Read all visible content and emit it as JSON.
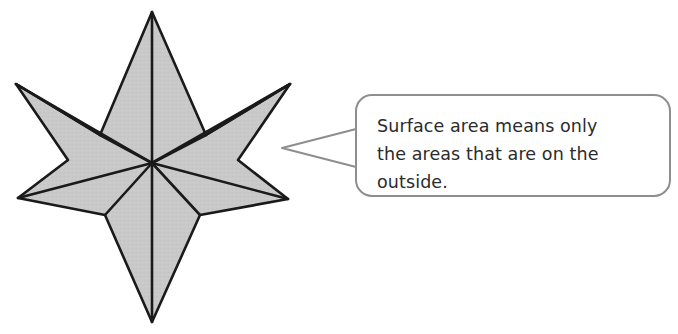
{
  "figure": {
    "background_color": "#ffffff"
  },
  "shape": {
    "name": "six-pointed-stellated-polyhedron",
    "fill_color": "#c9c9c9",
    "stroke_color": "#1a1a1a",
    "stroke_width": 2.6,
    "points": 6,
    "vertices": {
      "top": [
        152,
        12
      ],
      "upper_left": [
        16,
        84
      ],
      "upper_right": [
        290,
        84
      ],
      "lower_left": [
        18,
        198
      ],
      "lower_right": [
        288,
        199
      ],
      "bottom": [
        152,
        322
      ],
      "center": [
        152,
        163
      ],
      "inner_upper_left": [
        100,
        135
      ],
      "inner_upper_right": [
        206,
        135
      ],
      "inner_lower_left": [
        105,
        215
      ],
      "inner_lower_right": [
        200,
        215
      ],
      "notch_left": [
        68,
        160
      ],
      "notch_right": [
        238,
        160
      ]
    }
  },
  "callout": {
    "bubble": {
      "fill_color": "#ffffff",
      "stroke_color": "#8e8e8e",
      "stroke_width": 2,
      "corner_radius": 16,
      "x": 356,
      "y": 95,
      "width": 314,
      "height": 101
    },
    "tail": {
      "tip": [
        282,
        148
      ],
      "stroke_color": "#8e8e8e"
    },
    "text_lines": [
      "Surface area means only",
      "the areas that are on the",
      "outside."
    ],
    "full_text": "Surface area means only the areas that are on the outside.",
    "text_color": "#2b2b2b"
  }
}
